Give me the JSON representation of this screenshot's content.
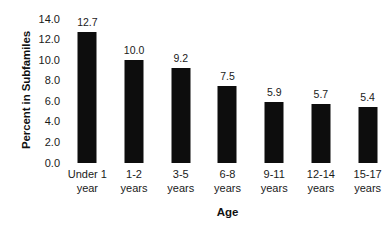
{
  "chart_data": {
    "type": "bar",
    "title": "",
    "xlabel": "Age",
    "ylabel": "Percent in Subfamiles",
    "categories": [
      "Under 1 year",
      "1-2 years",
      "3-5 years",
      "6-8 years",
      "9-11 years",
      "12-14 years",
      "15-17 years"
    ],
    "category_lines": [
      [
        "Under 1",
        "year"
      ],
      [
        "1-2",
        "years"
      ],
      [
        "3-5",
        "years"
      ],
      [
        "6-8",
        "years"
      ],
      [
        "9-11",
        "years"
      ],
      [
        "12-14",
        "years"
      ],
      [
        "15-17",
        "years"
      ]
    ],
    "values": [
      12.7,
      10.0,
      9.2,
      7.5,
      5.9,
      5.7,
      5.4
    ],
    "value_labels": [
      "12.7",
      "10.0",
      "9.2",
      "7.5",
      "5.9",
      "5.7",
      "5.4"
    ],
    "ylim": [
      0.0,
      14.0
    ],
    "ytick_values": [
      14.0,
      12.0,
      10.0,
      8.0,
      6.0,
      4.0,
      2.0,
      0.0
    ],
    "ytick_labels": [
      "14.0",
      "12.0",
      "10.0",
      "8.0",
      "6.0",
      "4.0",
      "2.0",
      "0.0"
    ],
    "grid": false,
    "legend": null,
    "bar_color": "#0d0d0d",
    "background_color": "#ffffff",
    "text_color": "#1a1a1a"
  }
}
